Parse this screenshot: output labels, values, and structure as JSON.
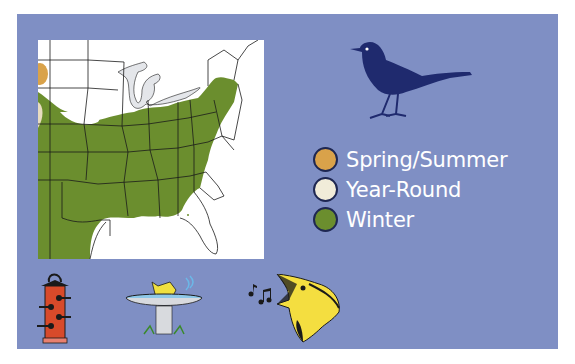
{
  "panel": {
    "background": "#7f8fc4"
  },
  "map": {
    "region": "Eastern United States",
    "colors": {
      "winter": "#6b8e2e",
      "spring_summer": "#d9a24a",
      "year_round": "#e8dcc0",
      "lakes": "#e4e6ea",
      "land": "#ffffff",
      "borders": "#1a1a1a"
    }
  },
  "legend": {
    "items": [
      {
        "label": "Spring/Summer",
        "color": "#d9a24a"
      },
      {
        "label": "Year-Round",
        "color": "#f1ecd9"
      },
      {
        "label": "Winter",
        "color": "#6b8e2e"
      }
    ]
  },
  "icons": {
    "silhouette": "bird-silhouette-icon",
    "feeder": "tube-feeder-icon",
    "birdbath": "birdbath-icon",
    "song": "singing-bird-icon"
  }
}
